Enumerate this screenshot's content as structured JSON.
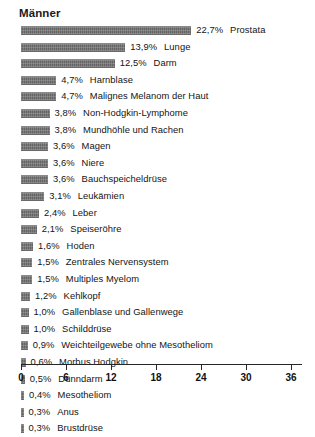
{
  "chart_data": {
    "type": "bar",
    "orientation": "horizontal",
    "title": "Männer",
    "xlabel": "",
    "ylabel": "",
    "xlim": [
      0,
      37.5
    ],
    "grid": false,
    "legend": null,
    "value_suffix": "%",
    "bar_color": "#737373",
    "axis_ticks": [
      0,
      6,
      12,
      18,
      24,
      30,
      36
    ],
    "categories": [
      "Prostata",
      "Lunge",
      "Darm",
      "Harnblase",
      "Malignes Melanom der Haut",
      "Non-Hodgkin-Lymphome",
      "Mundhöhle und Rachen",
      "Magen",
      "Niere",
      "Bauchspeicheldrüse",
      "Leukämien",
      "Leber",
      "Speiseröhre",
      "Hoden",
      "Zentrales Nervensystem",
      "Multiples Myelom",
      "Kehlkopf",
      "Gallenblase und Gallenwege",
      "Schilddrüse",
      "Weichteilgewebe ohne Mesotheliom",
      "Morbus Hodgkin",
      "Dünndarm",
      "Mesotheliom",
      "Anus",
      "Brustdrüse"
    ],
    "values": [
      22.7,
      13.9,
      12.5,
      4.7,
      4.7,
      3.8,
      3.8,
      3.6,
      3.6,
      3.6,
      3.1,
      2.4,
      2.1,
      1.6,
      1.5,
      1.5,
      1.2,
      1.0,
      1.0,
      0.9,
      0.6,
      0.5,
      0.4,
      0.3,
      0.3
    ],
    "value_labels": [
      "22,7%",
      "13,9%",
      "12,5%",
      "4,7%",
      "4,7%",
      "3,8%",
      "3,8%",
      "3,6%",
      "3,6%",
      "3,6%",
      "3,1%",
      "2,4%",
      "2,1%",
      "1,6%",
      "1,5%",
      "1,5%",
      "1,2%",
      "1,0%",
      "1,0%",
      "0,9%",
      "0,6%",
      "0,5%",
      "0,4%",
      "0,3%",
      "0,3%"
    ],
    "bars": [
      {
        "value_label": "22,7%",
        "name": "Prostata",
        "value": 22.7
      },
      {
        "value_label": "13,9%",
        "name": "Lunge",
        "value": 13.9
      },
      {
        "value_label": "12,5%",
        "name": "Darm",
        "value": 12.5
      },
      {
        "value_label": "4,7%",
        "name": "Harnblase",
        "value": 4.7
      },
      {
        "value_label": "4,7%",
        "name": "Malignes Melanom der Haut",
        "value": 4.7
      },
      {
        "value_label": "3,8%",
        "name": "Non-Hodgkin-Lymphome",
        "value": 3.8
      },
      {
        "value_label": "3,8%",
        "name": "Mundhöhle und Rachen",
        "value": 3.8
      },
      {
        "value_label": "3,6%",
        "name": "Magen",
        "value": 3.6
      },
      {
        "value_label": "3,6%",
        "name": "Niere",
        "value": 3.6
      },
      {
        "value_label": "3,6%",
        "name": "Bauchspeicheldrüse",
        "value": 3.6
      },
      {
        "value_label": "3,1%",
        "name": "Leukämien",
        "value": 3.1
      },
      {
        "value_label": "2,4%",
        "name": "Leber",
        "value": 2.4
      },
      {
        "value_label": "2,1%",
        "name": "Speiseröhre",
        "value": 2.1
      },
      {
        "value_label": "1,6%",
        "name": "Hoden",
        "value": 1.6
      },
      {
        "value_label": "1,5%",
        "name": "Zentrales Nervensystem",
        "value": 1.5
      },
      {
        "value_label": "1,5%",
        "name": "Multiples Myelom",
        "value": 1.5
      },
      {
        "value_label": "1,2%",
        "name": "Kehlkopf",
        "value": 1.2
      },
      {
        "value_label": "1,0%",
        "name": "Gallenblase und Gallenwege",
        "value": 1.0
      },
      {
        "value_label": "1,0%",
        "name": "Schilddrüse",
        "value": 1.0
      },
      {
        "value_label": "0,9%",
        "name": "Weichteilgewebe ohne Mesotheliom",
        "value": 0.9
      },
      {
        "value_label": "0,6%",
        "name": "Morbus Hodgkin",
        "value": 0.6
      },
      {
        "value_label": "0,5%",
        "name": "Dünndarm",
        "value": 0.5
      },
      {
        "value_label": "0,4%",
        "name": "Mesotheliom",
        "value": 0.4
      },
      {
        "value_label": "0,3%",
        "name": "Anus",
        "value": 0.3
      },
      {
        "value_label": "0,3%",
        "name": "Brustdrüse",
        "value": 0.3
      }
    ]
  }
}
